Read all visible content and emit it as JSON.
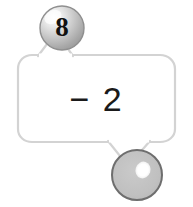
{
  "canvas": {
    "width": 193,
    "height": 207,
    "background_color": "#ffffff"
  },
  "bubble": {
    "name": "speech-bubble",
    "expression": "− 2",
    "stroke_color": "#d0d0d0",
    "fill_color": "#ffffff",
    "text_color": "#1a1a1a"
  },
  "balls": [
    {
      "id": "ball-top",
      "label": "8",
      "value": "8",
      "filled": true,
      "center_x": 62,
      "center_y": 28,
      "radius": 22,
      "body_color": "#b4b4b4",
      "highlight_color": "#f2f2f2",
      "outline_color": "#8c8c8c",
      "label_color": "#111111"
    },
    {
      "id": "ball-bottom",
      "label": "",
      "value": "",
      "filled": false,
      "center_x": 137,
      "center_y": 175,
      "radius": 25,
      "body_color": "#bdbdbd",
      "highlight_color": "#ffffff",
      "outline_color": "#6e6e6e",
      "label_color": "#111111"
    }
  ]
}
